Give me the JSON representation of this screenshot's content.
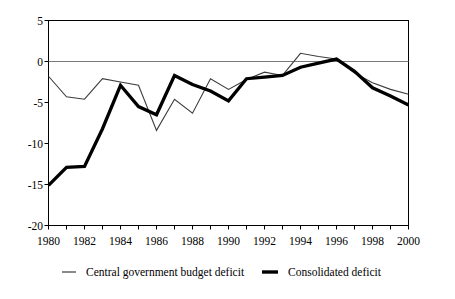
{
  "chart_data": {
    "type": "line",
    "title": "",
    "subtitle": "",
    "xlabel": "",
    "ylabel": "",
    "xlim": [
      1980,
      2000
    ],
    "ylim": [
      -20,
      5
    ],
    "yticks": [
      5,
      0,
      -5,
      -10,
      -15,
      -20
    ],
    "ytick_labels": [
      "5",
      "0",
      "-5",
      "-10",
      "-15",
      "-20"
    ],
    "xticks": [
      1980,
      1981,
      1982,
      1983,
      1984,
      1985,
      1986,
      1987,
      1988,
      1989,
      1990,
      1991,
      1992,
      1993,
      1994,
      1995,
      1996,
      1997,
      1998,
      1999,
      2000
    ],
    "xtick_labels": [
      "1980",
      "",
      "1982",
      "",
      "1984",
      "",
      "1986",
      "",
      "1988",
      "",
      "1990",
      "",
      "1992",
      "",
      "1994",
      "",
      "1996",
      "",
      "1998",
      "",
      "2000"
    ],
    "xtick_labels_shown": [
      "1980",
      "1982",
      "1984",
      "1986",
      "1988",
      "1990",
      "1992",
      "1994",
      "1996",
      "1998",
      "2000"
    ],
    "grid": false,
    "zero_line": true,
    "legend_position": "bottom",
    "x": [
      1980,
      1981,
      1982,
      1983,
      1984,
      1985,
      1986,
      1987,
      1988,
      1989,
      1990,
      1991,
      1992,
      1993,
      1994,
      1995,
      1996,
      1997,
      1998,
      1999,
      2000
    ],
    "series": [
      {
        "name": "Central government budget deficit",
        "style": "thin",
        "color": "#000000",
        "width": 1,
        "values": [
          -1.8,
          -4.3,
          -4.6,
          -2.1,
          -2.5,
          -2.9,
          -8.4,
          -4.6,
          -6.3,
          -2.1,
          -3.4,
          -2.2,
          -1.3,
          -1.7,
          1.0,
          0.6,
          0.3,
          -1.4,
          -2.6,
          -3.4,
          -4.0
        ]
      },
      {
        "name": "Consolidated deficit",
        "style": "thick",
        "color": "#000000",
        "width": 3.2,
        "values": [
          -15.1,
          -12.9,
          -12.8,
          -8.2,
          -2.9,
          -5.5,
          -6.5,
          -1.7,
          -2.8,
          -3.6,
          -4.8,
          -2.1,
          -1.9,
          -1.7,
          -0.7,
          -0.2,
          0.3,
          -1.2,
          -3.2,
          -4.2,
          -5.3
        ]
      }
    ]
  },
  "legend": {
    "items": [
      {
        "label": "Central government budget deficit",
        "marker": "thin-line-marker"
      },
      {
        "label": "Consolidated deficit",
        "marker": "thick-line-marker"
      }
    ]
  },
  "axes": {
    "y_tick_0": "5",
    "y_tick_1": "0",
    "y_tick_2": "-5",
    "y_tick_3": "-10",
    "y_tick_4": "-15",
    "y_tick_5": "-20",
    "x_tick_0": "1980",
    "x_tick_1": "1982",
    "x_tick_2": "1984",
    "x_tick_3": "1986",
    "x_tick_4": "1988",
    "x_tick_5": "1990",
    "x_tick_6": "1992",
    "x_tick_7": "1994",
    "x_tick_8": "1996",
    "x_tick_9": "1998",
    "x_tick_10": "2000"
  },
  "colors": {
    "axis": "#000000",
    "zero_line": "#7a7a7a",
    "series_thin": "#4a4a4a",
    "series_thick": "#000000",
    "background": "#ffffff"
  }
}
